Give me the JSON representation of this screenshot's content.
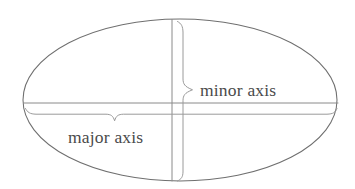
{
  "figure": {
    "title": "Ellipse with major and minor axes",
    "background_color": "#ffffff",
    "width": 355,
    "height": 189
  },
  "style": {
    "ellipse_stroke": "#6f6f6f",
    "axis_stroke": "#8a8a8a",
    "brace_stroke": "#9a9a9a",
    "label_color": "#4a4a4a"
  },
  "shape": {
    "type": "ellipse",
    "center_x": 180,
    "center_y": 100,
    "radius_x": 157,
    "radius_y": 81
  },
  "axes": {
    "major": {
      "label": "major axis",
      "orientation": "horizontal",
      "y": 103,
      "x_start": 23,
      "x_end": 338,
      "label_x": 68,
      "label_y": 143
    },
    "minor": {
      "label": "minor axis",
      "orientation": "vertical",
      "x": 172,
      "y_start": 19,
      "y_end": 181,
      "label_x": 200,
      "label_y": 96
    }
  },
  "braces": {
    "major_brace": {
      "name": "major-axis-brace",
      "point_x": 115,
      "point_y": 121,
      "left_x": 26,
      "right_x": 336,
      "top_y": 108
    },
    "minor_brace": {
      "name": "minor-axis-brace",
      "point_x": 193,
      "point_y": 90,
      "top_y": 22,
      "bottom_y": 180,
      "left_x": 180
    }
  }
}
